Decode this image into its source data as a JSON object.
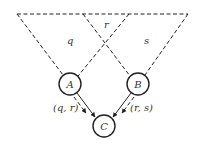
{
  "diagram": {
    "nodes": [
      {
        "id": "A",
        "label": "A",
        "cx": 70,
        "cy": 84,
        "r": 11
      },
      {
        "id": "B",
        "label": "B",
        "cx": 138,
        "cy": 84,
        "r": 11
      },
      {
        "id": "C",
        "label": "C",
        "cx": 104,
        "cy": 126,
        "r": 11
      }
    ],
    "regions": {
      "q": "q",
      "r": "r",
      "s": "s"
    },
    "edges": [
      {
        "from": "A",
        "to": "C",
        "label": "(q, r)"
      },
      {
        "from": "B",
        "to": "C",
        "label": "(r, s)"
      }
    ]
  }
}
